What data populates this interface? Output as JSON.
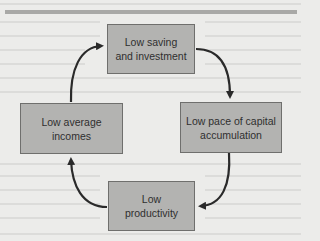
{
  "diagram": {
    "type": "cycle",
    "title": "",
    "nodes": [
      {
        "id": "saving",
        "lines": [
          "Low saving",
          "and investment"
        ]
      },
      {
        "id": "capital",
        "lines": [
          "Low pace of capital",
          "accumulation"
        ]
      },
      {
        "id": "productivity",
        "lines": [
          "Low",
          "productivity"
        ]
      },
      {
        "id": "incomes",
        "lines": [
          "Low average",
          "incomes"
        ]
      }
    ],
    "edges": [
      {
        "from": "saving",
        "to": "capital"
      },
      {
        "from": "capital",
        "to": "productivity"
      },
      {
        "from": "productivity",
        "to": "incomes"
      },
      {
        "from": "incomes",
        "to": "saving"
      }
    ],
    "colors": {
      "background": "#ececea",
      "box_fill": "#b3b3b1",
      "box_border": "#6f6f6d",
      "arrow": "#2a2a2a",
      "rule": "#a9a9a7"
    }
  }
}
